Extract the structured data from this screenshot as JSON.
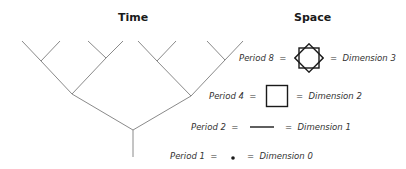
{
  "titles": {
    "time": "Time",
    "space": "Space"
  },
  "rows": [
    {
      "period": "Period 8",
      "equals": "=",
      "shape": "two-overlapping-squares-octagram",
      "dimension": "Dimension 3"
    },
    {
      "period": "Period 4",
      "equals": "=",
      "shape": "square",
      "dimension": "Dimension 2"
    },
    {
      "period": "Period 2",
      "equals": "=",
      "shape": "line-segment",
      "dimension": "Dimension 1"
    },
    {
      "period": "Period 1",
      "equals": "=",
      "shape": "point",
      "dimension": "Dimension 0"
    }
  ],
  "colors": {
    "tree_line": "#8a8a8a",
    "shape_stroke": "#1a1a1a",
    "text": "#333333"
  }
}
